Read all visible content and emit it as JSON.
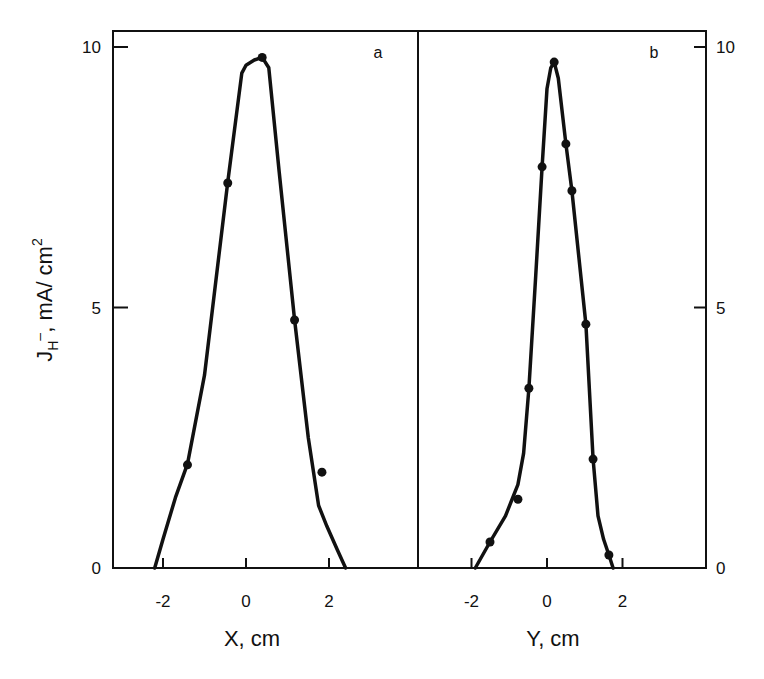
{
  "chart_data": [
    {
      "type": "line",
      "panel": "a",
      "title": "",
      "panel_label": "a",
      "xlabel": "X, cm",
      "ylabel": "J_H⁻, mA/ cm²",
      "xlim": [
        -3.0,
        4.2
      ],
      "ylim": [
        0,
        10.3
      ],
      "xticks": [
        -2,
        0,
        2
      ],
      "xtick_labels": [
        "-2",
        "0",
        "2"
      ],
      "yticks": [
        0,
        5,
        10
      ],
      "ytick_labels": [
        "0",
        "5",
        "10"
      ],
      "yaxis_side": "left",
      "grid": false,
      "series": [
        {
          "name": "measured",
          "kind": "scatter",
          "x": [
            -1.41,
            -0.44,
            0.39,
            1.17,
            1.83
          ],
          "y": [
            1.98,
            7.39,
            9.8,
            4.76,
            1.84
          ]
        },
        {
          "name": "fit",
          "kind": "line",
          "x": [
            -2.2,
            -2.0,
            -1.7,
            -1.41,
            -1.0,
            -0.44,
            -0.1,
            0.0,
            0.2,
            0.39,
            0.55,
            0.8,
            1.17,
            1.5,
            1.75,
            1.95,
            2.2,
            2.4
          ],
          "y": [
            0.0,
            0.55,
            1.35,
            2.0,
            3.7,
            7.4,
            9.5,
            9.65,
            9.75,
            9.8,
            9.6,
            7.6,
            4.76,
            2.5,
            1.2,
            0.8,
            0.35,
            0.0
          ]
        }
      ]
    },
    {
      "type": "line",
      "panel": "b",
      "title": "",
      "panel_label": "b",
      "xlabel": "Y, cm",
      "ylabel": "",
      "xlim": [
        -4.0,
        4.0
      ],
      "ylim": [
        0,
        10.3
      ],
      "xticks": [
        -2,
        0,
        2
      ],
      "xtick_labels": [
        "-2",
        "0",
        "2"
      ],
      "yticks": [
        0,
        5,
        10
      ],
      "ytick_labels": [
        "0",
        "5",
        "10"
      ],
      "yaxis_side": "right",
      "grid": false,
      "series": [
        {
          "name": "measured",
          "kind": "scatter",
          "x": [
            -1.51,
            -0.77,
            -0.48,
            -0.13,
            0.19,
            0.5,
            0.66,
            1.03,
            1.22,
            1.64
          ],
          "y": [
            0.5,
            1.32,
            3.45,
            7.7,
            9.71,
            8.14,
            7.24,
            4.68,
            2.09,
            0.25
          ]
        },
        {
          "name": "fit",
          "kind": "line",
          "x": [
            -1.9,
            -1.51,
            -1.1,
            -0.77,
            -0.62,
            -0.48,
            -0.3,
            -0.13,
            0.0,
            0.1,
            0.19,
            0.3,
            0.5,
            0.66,
            1.03,
            1.22,
            1.35,
            1.5,
            1.64,
            1.75
          ],
          "y": [
            0.0,
            0.5,
            1.0,
            1.6,
            2.2,
            3.45,
            5.6,
            7.7,
            9.2,
            9.6,
            9.71,
            9.4,
            8.14,
            7.24,
            4.68,
            2.09,
            1.0,
            0.55,
            0.25,
            0.0
          ]
        }
      ]
    }
  ]
}
